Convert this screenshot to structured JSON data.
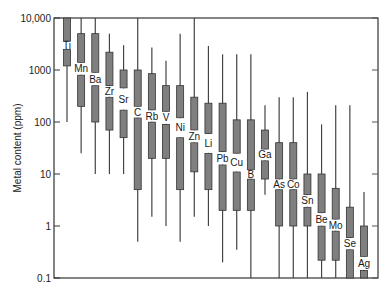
{
  "chart_data": {
    "type": "box",
    "title": "",
    "xlabel": "",
    "ylabel": "Metal content (ppm)",
    "yscale": "log",
    "ylim": [
      0.1,
      10000
    ],
    "yticks": [
      {
        "value": 10000,
        "label": "10,000"
      },
      {
        "value": 1000,
        "label": "1000"
      },
      {
        "value": 100,
        "label": "100"
      },
      {
        "value": 10,
        "label": "10"
      },
      {
        "value": 1,
        "label": "1"
      },
      {
        "value": 0.1,
        "label": "0.1"
      }
    ],
    "grid": false,
    "legend": null,
    "box_color": "#7f7f7f",
    "categories": [
      "Ti",
      "Mn",
      "Ba",
      "Zr",
      "Sr",
      "C",
      "Rb",
      "V",
      "Ni",
      "Zn",
      "Li",
      "Pb",
      "Cu",
      "B",
      "Ga",
      "As",
      "Co",
      "Sn",
      "Be",
      "Mo",
      "Se",
      "Ag"
    ],
    "series": [
      {
        "name": "Ti",
        "max": 10000,
        "q3": 10000,
        "upper_box_bottom": 3600,
        "lower_box_top": 2500,
        "q1": 1200,
        "min": 100
      },
      {
        "name": "Mn",
        "max": 10000,
        "q3": 5000,
        "upper_box_bottom": 1400,
        "lower_box_top": 800,
        "q1": 200,
        "min": 25
      },
      {
        "name": "Ba",
        "max": 10000,
        "q3": 5000,
        "upper_box_bottom": 900,
        "lower_box_top": 500,
        "q1": 100,
        "min": 10
      },
      {
        "name": "Zr",
        "max": 5000,
        "q3": 2200,
        "upper_box_bottom": 500,
        "lower_box_top": 300,
        "q1": 70,
        "min": 10
      },
      {
        "name": "Sr",
        "max": 3000,
        "q3": 1000,
        "upper_box_bottom": 450,
        "lower_box_top": 170,
        "q1": 50,
        "min": 10
      },
      {
        "name": "C",
        "max": 10000,
        "q3": 1000,
        "upper_box_bottom": 200,
        "lower_box_top": 120,
        "q1": 5,
        "min": 0.5
      },
      {
        "name": "Rb",
        "max": 2700,
        "q3": 850,
        "upper_box_bottom": 170,
        "lower_box_top": 100,
        "q1": 20,
        "min": 1.5
      },
      {
        "name": "V",
        "max": 1500,
        "q3": 500,
        "upper_box_bottom": 160,
        "lower_box_top": 90,
        "q1": 20,
        "min": 1
      },
      {
        "name": "Ni",
        "max": 5000,
        "q3": 500,
        "upper_box_bottom": 120,
        "lower_box_top": 50,
        "q1": 5,
        "min": 0.5
      },
      {
        "name": "Zn",
        "max": 10000,
        "q3": 300,
        "upper_box_bottom": 70,
        "lower_box_top": 40,
        "q1": 11,
        "min": 1.5
      },
      {
        "name": "Li",
        "max": 2900,
        "q3": 230,
        "upper_box_bottom": 60,
        "lower_box_top": 25,
        "q1": 5,
        "min": 1
      },
      {
        "name": "Pb",
        "max": 2000,
        "q3": 230,
        "upper_box_bottom": 27,
        "lower_box_top": 15,
        "q1": 2,
        "min": 0.2
      },
      {
        "name": "Cu",
        "max": 2000,
        "q3": 110,
        "upper_box_bottom": 25,
        "lower_box_top": 11,
        "q1": 2,
        "min": 0.35
      },
      {
        "name": "B",
        "max": 2000,
        "q3": 110,
        "upper_box_bottom": 12,
        "lower_box_top": 8,
        "q1": 2,
        "min": 0.1
      },
      {
        "name": "Ga",
        "max": 210,
        "q3": 70,
        "upper_box_bottom": 30,
        "lower_box_top": 18,
        "q1": 8,
        "min": 4
      },
      {
        "name": "As",
        "max": 300,
        "q3": 40,
        "upper_box_bottom": 8,
        "lower_box_top": 5,
        "q1": 1,
        "min": 0.1
      },
      {
        "name": "Co",
        "max": 300,
        "q3": 40,
        "upper_box_bottom": 8,
        "lower_box_top": 5,
        "q1": 1,
        "min": 0.1
      },
      {
        "name": "Sn",
        "max": 380,
        "q3": 10,
        "upper_box_bottom": 4,
        "lower_box_top": 2.3,
        "q1": 1,
        "min": 0.1
      },
      {
        "name": "Be",
        "max": 90,
        "q3": 10,
        "upper_box_bottom": 1.8,
        "lower_box_top": 1,
        "q1": 0.22,
        "min": 0.1
      },
      {
        "name": "Mo",
        "max": 210,
        "q3": 5.3,
        "upper_box_bottom": 1.35,
        "lower_box_top": 0.8,
        "q1": 0.22,
        "min": 0.1
      },
      {
        "name": "Se",
        "max": 210,
        "q3": 2.3,
        "upper_box_bottom": 0.6,
        "lower_box_top": 0.35,
        "q1": 0.1,
        "min": 0.1
      },
      {
        "name": "Ag",
        "max": 4.5,
        "q3": 1,
        "upper_box_bottom": 0.26,
        "lower_box_top": 0.14,
        "q1": 0.1,
        "min": 0.1
      }
    ]
  }
}
